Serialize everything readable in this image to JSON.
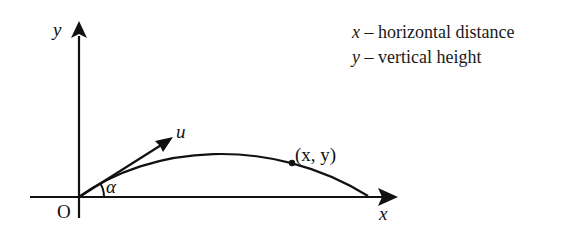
{
  "diagram": {
    "axes": {
      "x_label": "x",
      "y_label": "y",
      "origin_label": "O"
    },
    "velocity": {
      "label": "u",
      "angle_label": "α"
    },
    "point": {
      "label": "(x, y)"
    },
    "legend": [
      {
        "var": "x",
        "dash": " – ",
        "desc": "horizontal distance"
      },
      {
        "var": "y",
        "dash": " – ",
        "desc": "vertical height"
      }
    ],
    "colors": {
      "ink": "#111111",
      "background": "#ffffff"
    }
  }
}
